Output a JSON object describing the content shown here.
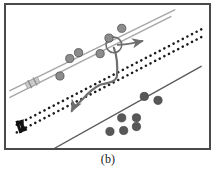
{
  "figure": {
    "caption": "(b)",
    "panel_label": "(b)",
    "frame_color": "#4a4a4a",
    "background_color": "#ffffff"
  },
  "chart_data": {
    "type": "scatter",
    "title": "",
    "subtitle": "",
    "xlabel": "",
    "ylabel": "",
    "xlim": [
      0,
      207
    ],
    "ylim": [
      0,
      147
    ],
    "grid": false,
    "legend_position": "none",
    "colors": {
      "road_gray": "#a8a8a8",
      "road_dotted": "#1c1c1c",
      "road_solid": "#5a5a5a",
      "point_gray": "#8c8c8c",
      "point_dark": "#585858",
      "trajectory": "#6e6e6e",
      "marker_black": "#111111",
      "marker_light": "#bdbdbd"
    },
    "annotations": [
      {
        "name": "heading-arrow",
        "label": "",
        "x": 140,
        "y": 40,
        "direction": "east"
      },
      {
        "name": "trajectory-arrow",
        "label": "",
        "x": 66,
        "y": 110,
        "direction": "southwest"
      },
      {
        "name": "highlight-circle",
        "label": "",
        "x": 110,
        "y": 41,
        "r": 8
      }
    ],
    "series": [
      {
        "name": "road-gray-upper",
        "type": "line",
        "style": "solid",
        "color": "#a8a8a8",
        "width": 1.6,
        "x": [
          4,
          172
        ],
        "y": [
          88,
          5
        ]
      },
      {
        "name": "road-gray-lower",
        "type": "line",
        "style": "solid",
        "color": "#a8a8a8",
        "width": 1.6,
        "x": [
          4,
          168
        ],
        "y": [
          95,
          12
        ]
      },
      {
        "name": "road-dotted-upper",
        "type": "line",
        "style": "dotted",
        "color": "#1c1c1c",
        "width": 2.4,
        "x": [
          11,
          203
        ],
        "y": [
          123,
          23
        ]
      },
      {
        "name": "road-dotted-lower",
        "type": "line",
        "style": "dotted",
        "color": "#1c1c1c",
        "width": 2.4,
        "x": [
          11,
          203
        ],
        "y": [
          131,
          31
        ]
      },
      {
        "name": "road-solid-lower",
        "type": "line",
        "style": "solid",
        "color": "#5a5a5a",
        "width": 1.4,
        "x": [
          50,
          199
        ],
        "y": [
          147,
          63
        ]
      },
      {
        "name": "gps-points-upper",
        "type": "scatter",
        "color": "#8c8c8c",
        "radius": 4.2,
        "points": [
          {
            "x": 55,
            "y": 73
          },
          {
            "x": 65,
            "y": 55
          },
          {
            "x": 74,
            "y": 49
          },
          {
            "x": 96,
            "y": 50
          },
          {
            "x": 105,
            "y": 34
          },
          {
            "x": 118,
            "y": 24
          }
        ]
      },
      {
        "name": "gps-points-lower",
        "type": "scatter",
        "color": "#585858",
        "radius": 4.2,
        "points": [
          {
            "x": 106,
            "y": 130
          },
          {
            "x": 120,
            "y": 129
          },
          {
            "x": 133,
            "y": 125
          },
          {
            "x": 118,
            "y": 116
          },
          {
            "x": 133,
            "y": 116
          },
          {
            "x": 141,
            "y": 94
          },
          {
            "x": 155,
            "y": 98
          }
        ]
      },
      {
        "name": "vehicle-trajectory",
        "type": "path",
        "color": "#6e6e6e",
        "width": 2.2,
        "points": [
          {
            "x": 110,
            "y": 44
          },
          {
            "x": 113,
            "y": 58
          },
          {
            "x": 113,
            "y": 74
          },
          {
            "x": 106,
            "y": 80
          },
          {
            "x": 96,
            "y": 82
          },
          {
            "x": 88,
            "y": 91
          },
          {
            "x": 78,
            "y": 98
          },
          {
            "x": 70,
            "y": 104
          },
          {
            "x": 66,
            "y": 110
          }
        ]
      }
    ],
    "markers": [
      {
        "name": "origin-marker-black",
        "x": 17,
        "y": 124,
        "color": "#111111",
        "shape": "vehicle"
      },
      {
        "name": "vehicle-marker-light",
        "x": 27,
        "y": 80,
        "color": "#bdbdbd",
        "shape": "vehicle"
      }
    ]
  }
}
